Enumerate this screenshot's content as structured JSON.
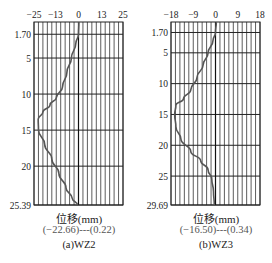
{
  "chart_data": [
    {
      "type": "line",
      "title": "(a)WZ2",
      "xlabel": "位移(mm)",
      "range_note": "(−22.66)---(0.22)",
      "ylabel": "",
      "x_ticks": [
        -25,
        -13,
        0,
        13,
        25
      ],
      "y_ticks": [
        1.7,
        5,
        10,
        15,
        20,
        25.39
      ],
      "xlim": [
        -25,
        25
      ],
      "ylim": [
        0,
        25.39
      ],
      "y_inverted": true,
      "grid": true,
      "series": [
        {
          "name": "WZ2",
          "x": [
            0.22,
            0,
            -1.5,
            -4,
            -6.5,
            -9,
            -12.5,
            -16,
            -20,
            -22.66,
            -22.5,
            -19,
            -15,
            -11,
            -7,
            -3.5,
            -0.5
          ],
          "y": [
            0,
            1.7,
            3,
            5,
            7,
            9,
            10.5,
            11.5,
            12.5,
            13.5,
            15,
            17,
            19,
            21,
            23,
            24.5,
            25.39
          ]
        }
      ]
    },
    {
      "type": "line",
      "title": "(b)WZ3",
      "xlabel": "位移(mm)",
      "range_note": "(−16.50)---(0.34)",
      "ylabel": "",
      "x_ticks": [
        -18,
        -9,
        0,
        9,
        18
      ],
      "y_ticks": [
        1.7,
        5,
        10,
        15,
        20,
        25,
        29.69
      ],
      "xlim": [
        -18,
        18
      ],
      "ylim": [
        0,
        29.69
      ],
      "y_inverted": true,
      "grid": true,
      "series": [
        {
          "name": "WZ3",
          "x": [
            0.34,
            0,
            -1,
            -3,
            -5,
            -7.5,
            -10,
            -13,
            -16,
            -16.5,
            -16,
            -14,
            -10,
            -6,
            -3,
            -1.5,
            -0.8,
            -0.5
          ],
          "y": [
            0,
            1.7,
            3,
            5,
            7,
            9,
            11,
            12.5,
            13.5,
            15,
            17,
            19,
            21,
            22.5,
            24,
            25.5,
            27.5,
            29.69
          ]
        }
      ]
    }
  ],
  "captions": {
    "a": {
      "xlabel": "位移(mm)",
      "range": "(−22.66)---(0.22)",
      "title": "(a)WZ2"
    },
    "b": {
      "xlabel": "位移(mm)",
      "range": "(−16.50)---(0.34)",
      "title": "(b)WZ3"
    }
  }
}
